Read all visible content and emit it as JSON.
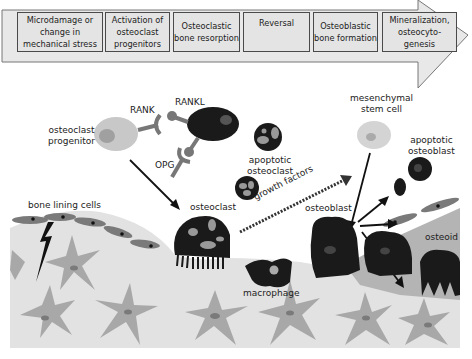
{
  "timeline": {
    "stages": [
      {
        "label": "Microdamage or change in mechanical stress"
      },
      {
        "label": "Activation of osteoclast progenitors"
      },
      {
        "label": "Osteoclastic bone resorption"
      },
      {
        "label": "Reversal"
      },
      {
        "label": "Osteoblastic bone formation"
      },
      {
        "label": "Mineralization, osteocyto-genesis"
      }
    ]
  },
  "labels": {
    "rank": "RANK",
    "rankl": "RANKL",
    "opg": "OPG",
    "osteoclast_progenitor_1": "osteoclast",
    "osteoclast_progenitor_2": "progenitor",
    "apoptotic_osteoclast_1": "apoptotic",
    "apoptotic_osteoclast_2": "osteoclast",
    "mesenchymal_1": "mesenchymal",
    "mesenchymal_2": "stem cell",
    "apoptotic_osteoblast_1": "apoptotic",
    "apoptotic_osteoblast_2": "osteoblast",
    "growth_factors": "growth factors",
    "bone_lining_cells": "bone lining cells",
    "osteoclast": "osteoclast",
    "osteoblast": "osteoblast",
    "osteoid": "osteoid",
    "macrophage": "macrophage"
  },
  "colors": {
    "dark_cell": "#1a1a1a",
    "light_cell": "#c8c8c8",
    "bone": "#e2e2e2",
    "osteocyte": "#a8a8a8",
    "lining_cell": "#7a7a7a",
    "osteoid": "#b4b4b4",
    "stage_fill": "#e4e4e4"
  }
}
